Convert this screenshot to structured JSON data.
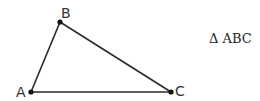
{
  "diagram": {
    "title": "Δ ABC",
    "stroke_color": "#2a2a2a",
    "vertices": [
      {
        "label": "A",
        "x": 31,
        "y": 92
      },
      {
        "label": "B",
        "x": 60,
        "y": 22
      },
      {
        "label": "C",
        "x": 171,
        "y": 92
      }
    ],
    "edges": [
      [
        "A",
        "B"
      ],
      [
        "B",
        "C"
      ],
      [
        "C",
        "A"
      ]
    ]
  }
}
